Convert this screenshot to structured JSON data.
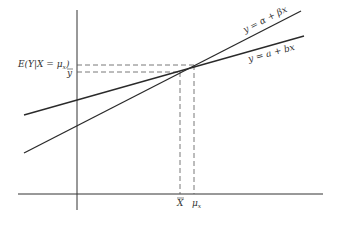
{
  "diagram": {
    "type": "regression-lines",
    "lines": [
      {
        "label": "y = α + βx",
        "name": "population-regression-line"
      },
      {
        "label": "y = a + bx",
        "name": "sample-regression-line"
      }
    ],
    "y_labels": {
      "conditional_mean": "E(Y|X = μ",
      "conditional_mean_sub": "x",
      "conditional_mean_close": ")",
      "y_bar": "y"
    },
    "x_labels": {
      "x_bar": "X",
      "mu": "μ",
      "mu_sub": "x"
    },
    "colors": {
      "line": "#2a2a2a",
      "dash": "#555555",
      "axis": "#333333"
    }
  }
}
